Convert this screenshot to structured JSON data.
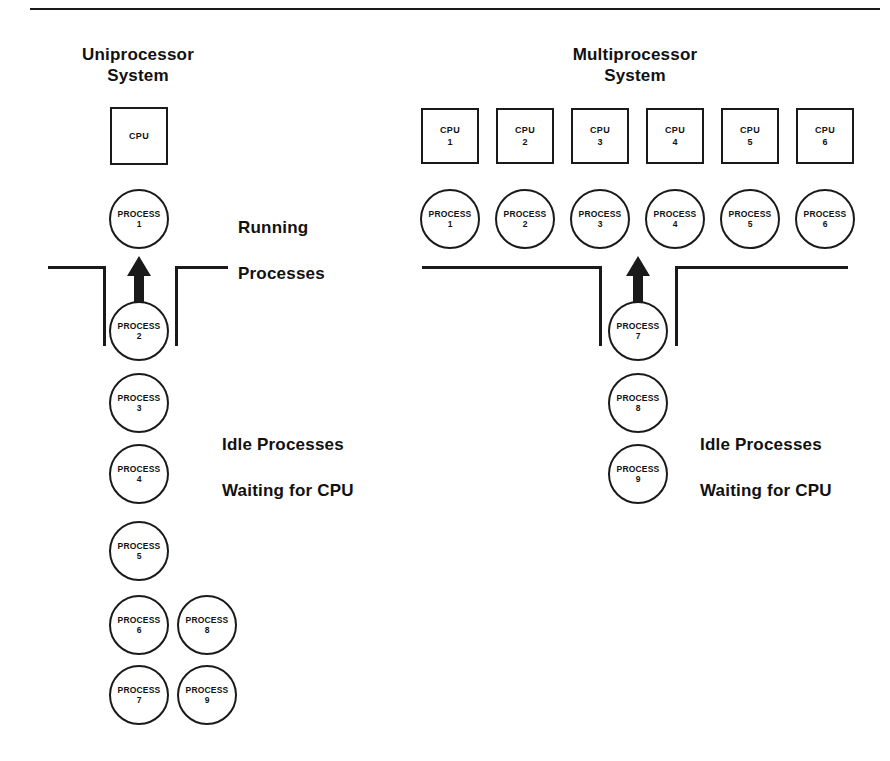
{
  "figure": {
    "top_rule": true,
    "background": "#ffffff",
    "ink_color": "#1a1a1a"
  },
  "uniprocessor": {
    "title": "Uniprocessor\nSystem",
    "title_line1": "Uniprocessor",
    "title_line2": "System",
    "cpus": [
      {
        "name": "CPU",
        "number": ""
      }
    ],
    "running_label_line1": "Running",
    "running_label_line2": "Processes",
    "idle_label_line1": "Idle Processes",
    "idle_label_line2": "Waiting for CPU",
    "running_processes": [
      {
        "name": "PROCESS",
        "number": "1"
      }
    ],
    "queue_main": [
      {
        "name": "PROCESS",
        "number": "2"
      },
      {
        "name": "PROCESS",
        "number": "3"
      },
      {
        "name": "PROCESS",
        "number": "4"
      },
      {
        "name": "PROCESS",
        "number": "5"
      },
      {
        "name": "PROCESS",
        "number": "6"
      },
      {
        "name": "PROCESS",
        "number": "7"
      }
    ],
    "queue_second": [
      {
        "name": "PROCESS",
        "number": "8"
      },
      {
        "name": "PROCESS",
        "number": "9"
      }
    ]
  },
  "multiprocessor": {
    "title_line1": "Multiprocessor",
    "title_line2": "System",
    "cpus": [
      {
        "name": "CPU",
        "number": "1"
      },
      {
        "name": "CPU",
        "number": "2"
      },
      {
        "name": "CPU",
        "number": "3"
      },
      {
        "name": "CPU",
        "number": "4"
      },
      {
        "name": "CPU",
        "number": "5"
      },
      {
        "name": "CPU",
        "number": "6"
      }
    ],
    "idle_label_line1": "Idle Processes",
    "idle_label_line2": "Waiting for CPU",
    "running_processes": [
      {
        "name": "PROCESS",
        "number": "1"
      },
      {
        "name": "PROCESS",
        "number": "2"
      },
      {
        "name": "PROCESS",
        "number": "3"
      },
      {
        "name": "PROCESS",
        "number": "4"
      },
      {
        "name": "PROCESS",
        "number": "5"
      },
      {
        "name": "PROCESS",
        "number": "6"
      }
    ],
    "queue_main": [
      {
        "name": "PROCESS",
        "number": "7"
      },
      {
        "name": "PROCESS",
        "number": "8"
      },
      {
        "name": "PROCESS",
        "number": "9"
      }
    ]
  }
}
